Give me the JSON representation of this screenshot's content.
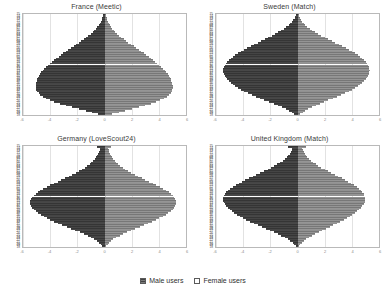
{
  "legend": {
    "position": "bottom-center",
    "items": [
      {
        "key": "male",
        "label": "Male users",
        "color": "#6f6f6f"
      },
      {
        "key": "female",
        "label": "Female users",
        "color": "#c9c9c9"
      }
    ]
  },
  "chart_data": [
    {
      "type": "bar",
      "subtype": "population-pyramid",
      "title": "France (Meetic)",
      "xlabel": "",
      "ylabel": "",
      "grid": true,
      "legend_position": "bottom",
      "ages": [
        75,
        74,
        73,
        72,
        71,
        70,
        69,
        68,
        67,
        66,
        65,
        64,
        63,
        62,
        61,
        60,
        59,
        58,
        57,
        56,
        55,
        54,
        53,
        52,
        51,
        50,
        49,
        48,
        47,
        46,
        45,
        44,
        43,
        42,
        41,
        40,
        39,
        38,
        37,
        36,
        35,
        34,
        33,
        32,
        31,
        30,
        29,
        28,
        27,
        26,
        25,
        24,
        23,
        22,
        21,
        20,
        19,
        18
      ],
      "xtick_labels": [
        "-6",
        "-4",
        "-2",
        "0",
        "2",
        "4",
        "6"
      ],
      "xlim": [
        -6,
        6
      ],
      "series": [
        {
          "name": "Male users",
          "side": "left",
          "values": [
            0.1,
            0.14,
            0.18,
            0.22,
            0.28,
            0.34,
            0.42,
            0.52,
            0.62,
            0.74,
            0.88,
            1.02,
            1.18,
            1.34,
            1.52,
            1.7,
            1.9,
            2.08,
            2.28,
            2.46,
            2.66,
            2.84,
            3.02,
            3.2,
            3.38,
            3.56,
            3.72,
            3.88,
            4.02,
            4.18,
            4.32,
            4.44,
            4.56,
            4.66,
            4.76,
            4.84,
            4.9,
            4.96,
            5.0,
            5.04,
            5.06,
            5.08,
            5.06,
            5.02,
            4.96,
            4.86,
            4.72,
            4.54,
            4.32,
            4.04,
            3.7,
            3.3,
            2.86,
            2.38,
            1.88,
            1.38,
            0.9,
            0.46
          ]
        },
        {
          "name": "Female users",
          "side": "right",
          "values": [
            0.08,
            0.11,
            0.15,
            0.19,
            0.24,
            0.3,
            0.37,
            0.46,
            0.56,
            0.68,
            0.8,
            0.94,
            1.08,
            1.24,
            1.4,
            1.58,
            1.76,
            1.94,
            2.14,
            2.32,
            2.52,
            2.7,
            2.88,
            3.06,
            3.24,
            3.42,
            3.58,
            3.74,
            3.9,
            4.04,
            4.18,
            4.32,
            4.44,
            4.54,
            4.64,
            4.72,
            4.8,
            4.86,
            4.92,
            4.96,
            5.0,
            5.02,
            5.02,
            5.0,
            4.94,
            4.86,
            4.74,
            4.58,
            4.38,
            4.12,
            3.8,
            3.42,
            3.0,
            2.54,
            2.04,
            1.54,
            1.04,
            0.56
          ]
        }
      ]
    },
    {
      "type": "bar",
      "subtype": "population-pyramid",
      "title": "Sweden (Match)",
      "xlabel": "",
      "ylabel": "",
      "grid": true,
      "legend_position": "bottom",
      "ages": [
        75,
        74,
        73,
        72,
        71,
        70,
        69,
        68,
        67,
        66,
        65,
        64,
        63,
        62,
        61,
        60,
        59,
        58,
        57,
        56,
        55,
        54,
        53,
        52,
        51,
        50,
        49,
        48,
        47,
        46,
        45,
        44,
        43,
        42,
        41,
        40,
        39,
        38,
        37,
        36,
        35,
        34,
        33,
        32,
        31,
        30,
        29,
        28,
        27,
        26,
        25,
        24,
        23,
        22,
        21,
        20,
        19,
        18
      ],
      "xtick_labels": [
        "-6",
        "-4",
        "-2",
        "0",
        "2",
        "4",
        "6"
      ],
      "xlim": [
        -6,
        6
      ],
      "series": [
        {
          "name": "Male users",
          "side": "left",
          "values": [
            0.12,
            0.16,
            0.22,
            0.3,
            0.4,
            0.52,
            0.66,
            0.82,
            1.0,
            1.2,
            1.42,
            1.66,
            1.9,
            2.16,
            2.42,
            2.68,
            2.94,
            3.2,
            3.46,
            3.7,
            3.94,
            4.16,
            4.38,
            4.58,
            4.76,
            4.92,
            5.06,
            5.18,
            5.28,
            5.36,
            5.42,
            5.46,
            5.48,
            5.46,
            5.42,
            5.36,
            5.28,
            5.18,
            5.06,
            4.92,
            4.76,
            4.58,
            4.38,
            4.16,
            3.92,
            3.66,
            3.38,
            3.08,
            2.76,
            2.44,
            2.1,
            1.76,
            1.44,
            1.14,
            0.86,
            0.62,
            0.42,
            0.24
          ]
        },
        {
          "name": "Female users",
          "side": "right",
          "values": [
            0.1,
            0.13,
            0.18,
            0.25,
            0.34,
            0.45,
            0.58,
            0.73,
            0.9,
            1.09,
            1.3,
            1.53,
            1.76,
            2.01,
            2.26,
            2.52,
            2.78,
            3.04,
            3.3,
            3.54,
            3.78,
            4.0,
            4.22,
            4.42,
            4.6,
            4.76,
            4.9,
            5.02,
            5.12,
            5.2,
            5.26,
            5.3,
            5.32,
            5.3,
            5.26,
            5.2,
            5.12,
            5.02,
            4.9,
            4.76,
            4.6,
            4.42,
            4.22,
            4.0,
            3.76,
            3.5,
            3.22,
            2.92,
            2.6,
            2.28,
            1.96,
            1.64,
            1.34,
            1.06,
            0.8,
            0.58,
            0.4,
            0.22
          ]
        }
      ]
    },
    {
      "type": "bar",
      "subtype": "population-pyramid",
      "title": "Germany (LoveScout24)",
      "xlabel": "",
      "ylabel": "",
      "grid": true,
      "legend_position": "bottom",
      "ages": [
        75,
        74,
        73,
        72,
        71,
        70,
        69,
        68,
        67,
        66,
        65,
        64,
        63,
        62,
        61,
        60,
        59,
        58,
        57,
        56,
        55,
        54,
        53,
        52,
        51,
        50,
        49,
        48,
        47,
        46,
        45,
        44,
        43,
        42,
        41,
        40,
        39,
        38,
        37,
        36,
        35,
        34,
        33,
        32,
        31,
        30,
        29,
        28,
        27,
        26,
        25,
        24,
        23,
        22,
        21,
        20,
        19,
        18
      ],
      "xtick_labels": [
        "-6",
        "-4",
        "-2",
        "0",
        "2",
        "4",
        "6"
      ],
      "xlim": [
        -6,
        6
      ],
      "series": [
        {
          "name": "Male users",
          "side": "left",
          "values": [
            0.55,
            0.3,
            0.34,
            0.4,
            0.46,
            0.54,
            0.62,
            0.72,
            0.84,
            0.96,
            1.1,
            1.26,
            1.44,
            1.64,
            1.86,
            2.1,
            2.36,
            2.62,
            2.9,
            3.18,
            3.46,
            3.74,
            4.0,
            4.26,
            4.5,
            4.72,
            4.92,
            5.08,
            5.22,
            5.34,
            5.42,
            5.48,
            5.5,
            5.48,
            5.42,
            5.34,
            5.22,
            5.08,
            4.9,
            4.7,
            4.48,
            4.24,
            3.98,
            3.7,
            3.4,
            3.1,
            2.78,
            2.46,
            2.14,
            1.82,
            1.52,
            1.24,
            0.98,
            0.74,
            0.54,
            0.38,
            0.26,
            0.16
          ]
        },
        {
          "name": "Female users",
          "side": "right",
          "values": [
            0.48,
            0.26,
            0.3,
            0.35,
            0.41,
            0.48,
            0.56,
            0.65,
            0.76,
            0.88,
            1.01,
            1.16,
            1.33,
            1.52,
            1.73,
            1.96,
            2.21,
            2.46,
            2.73,
            3.0,
            3.28,
            3.55,
            3.81,
            4.06,
            4.3,
            4.52,
            4.72,
            4.88,
            5.02,
            5.14,
            5.22,
            5.28,
            5.3,
            5.28,
            5.22,
            5.14,
            5.02,
            4.88,
            4.7,
            4.5,
            4.28,
            4.04,
            3.78,
            3.5,
            3.2,
            2.9,
            2.58,
            2.26,
            1.96,
            1.66,
            1.38,
            1.12,
            0.88,
            0.66,
            0.48,
            0.34,
            0.23,
            0.14
          ]
        }
      ]
    },
    {
      "type": "bar",
      "subtype": "population-pyramid",
      "title": "United Kingdom (Match)",
      "xlabel": "",
      "ylabel": "",
      "grid": true,
      "legend_position": "bottom",
      "ages": [
        75,
        74,
        73,
        72,
        71,
        70,
        69,
        68,
        67,
        66,
        65,
        64,
        63,
        62,
        61,
        60,
        59,
        58,
        57,
        56,
        55,
        54,
        53,
        52,
        51,
        50,
        49,
        48,
        47,
        46,
        45,
        44,
        43,
        42,
        41,
        40,
        39,
        38,
        37,
        36,
        35,
        34,
        33,
        32,
        31,
        30,
        29,
        28,
        27,
        26,
        25,
        24,
        23,
        22,
        21,
        20,
        19,
        18
      ],
      "xtick_labels": [
        "-6",
        "-4",
        "-2",
        "0",
        "2",
        "4",
        "6"
      ],
      "xlim": [
        -6,
        6
      ],
      "series": [
        {
          "name": "Male users",
          "side": "left",
          "values": [
            0.7,
            0.4,
            0.44,
            0.5,
            0.58,
            0.68,
            0.8,
            0.94,
            1.1,
            1.28,
            1.48,
            1.7,
            1.94,
            2.2,
            2.46,
            2.74,
            3.02,
            3.3,
            3.58,
            3.84,
            4.1,
            4.34,
            4.56,
            4.76,
            4.94,
            5.1,
            5.24,
            5.34,
            5.42,
            5.48,
            5.5,
            5.48,
            5.44,
            5.36,
            5.26,
            5.14,
            5.0,
            4.84,
            4.66,
            4.46,
            4.24,
            4.0,
            3.76,
            3.5,
            3.22,
            2.94,
            2.64,
            2.34,
            2.04,
            1.74,
            1.46,
            1.18,
            0.94,
            0.72,
            0.52,
            0.36,
            0.24,
            0.14
          ]
        },
        {
          "name": "Female users",
          "side": "right",
          "values": [
            0.62,
            0.35,
            0.39,
            0.45,
            0.52,
            0.61,
            0.72,
            0.85,
            0.99,
            1.15,
            1.33,
            1.53,
            1.75,
            1.99,
            2.23,
            2.49,
            2.75,
            3.01,
            3.27,
            3.51,
            3.75,
            3.97,
            4.17,
            4.35,
            4.51,
            4.65,
            4.77,
            4.86,
            4.93,
            4.98,
            5.0,
            4.98,
            4.94,
            4.87,
            4.78,
            4.67,
            4.54,
            4.39,
            4.22,
            4.04,
            3.84,
            3.62,
            3.4,
            3.16,
            2.9,
            2.64,
            2.37,
            2.1,
            1.83,
            1.56,
            1.31,
            1.06,
            0.84,
            0.64,
            0.46,
            0.32,
            0.21,
            0.12
          ]
        }
      ]
    }
  ]
}
